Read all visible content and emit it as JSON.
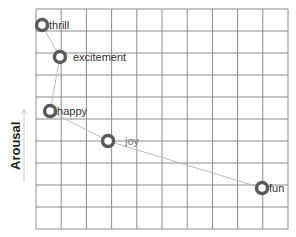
{
  "chart_data": {
    "type": "line",
    "title": "",
    "xlabel": "",
    "ylabel": "Arousal",
    "xlim": [
      0,
      10
    ],
    "ylim": [
      0,
      10
    ],
    "grid": true,
    "grid_columns": 10,
    "grid_rows": 10,
    "legend": null,
    "series": [
      {
        "name": "emotions",
        "points": [
          {
            "label": "thrill",
            "x": 0.24,
            "y": 9.27
          },
          {
            "label": "excitement",
            "x": 0.95,
            "y": 7.82
          },
          {
            "label": "happy",
            "x": 0.56,
            "y": 5.36
          },
          {
            "label": "joy",
            "x": 2.86,
            "y": 4.0
          },
          {
            "label": "fun",
            "x": 8.97,
            "y": 1.86
          }
        ]
      }
    ],
    "colors": {
      "grid": "#8c8c8c",
      "line": "#bdbdbd",
      "marker_ring": "#5a5a5a",
      "marker_center": "#ffffff",
      "label": "#333333",
      "label_light": "#777777"
    }
  },
  "axis": {
    "y_label": "Arousal",
    "y_arrow": "up-arrow"
  }
}
